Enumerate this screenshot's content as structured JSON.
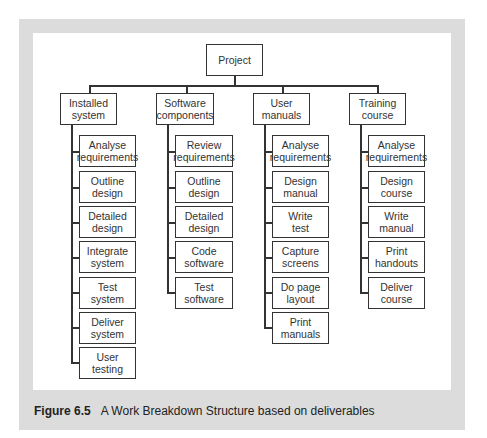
{
  "diagram": {
    "root": {
      "label": "Project"
    },
    "branches": [
      {
        "label": "Installed\nsystem",
        "children": [
          "Analyse\nrequirements",
          "Outline\ndesign",
          "Detailed\ndesign",
          "Integrate\nsystem",
          "Test\nsystem",
          "Deliver\nsystem",
          "User\ntesting"
        ]
      },
      {
        "label": "Software\ncomponents",
        "children": [
          "Review\nrequirements",
          "Outline\ndesign",
          "Detailed\ndesign",
          "Code\nsoftware",
          "Test\nsoftware"
        ]
      },
      {
        "label": "User\nmanuals",
        "children": [
          "Analyse\nrequirements",
          "Design\nmanual",
          "Write\ntest",
          "Capture\nscreens",
          "Do page\nlayout",
          "Print\nmanuals"
        ]
      },
      {
        "label": "Training\ncourse",
        "children": [
          "Analyse\nrequirements",
          "Design\ncourse",
          "Write\nmanual",
          "Print\nhandouts",
          "Deliver\ncourse"
        ]
      }
    ]
  },
  "caption": {
    "figure_label": "Figure 6.5",
    "text": "A Work Breakdown Structure based on deliverables"
  }
}
